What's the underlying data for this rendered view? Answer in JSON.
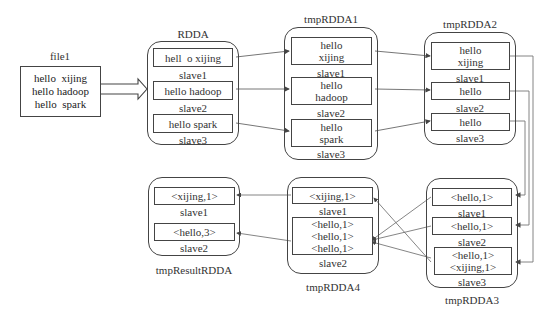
{
  "file1": {
    "title": "file1",
    "content": "hello  xijing\nhello hadoop\nhello  spark"
  },
  "rdda": {
    "title": "RDDA",
    "partitions": [
      {
        "text": "hell  o xijing",
        "node": "slave1"
      },
      {
        "text": "hello hadoop",
        "node": "slave2"
      },
      {
        "text": "hello spark",
        "node": "slave3"
      }
    ]
  },
  "tmpRDDA1": {
    "title": "tmpRDDA1",
    "partitions": [
      {
        "text": "hello\nxijing",
        "node": "slave1"
      },
      {
        "text": "hello\nhadoop",
        "node": "slave2"
      },
      {
        "text": "hello\nspark",
        "node": "slave3"
      }
    ]
  },
  "tmpRDDA2": {
    "title": "tmpRDDA2",
    "partitions": [
      {
        "text": "hello\nxijing",
        "node": "slave1"
      },
      {
        "text": "hello",
        "node": "slave2"
      },
      {
        "text": "hello",
        "node": "slave3"
      }
    ]
  },
  "tmpRDDA3": {
    "title": "tmpRDDA3",
    "partitions": [
      {
        "text": "<hello,1>",
        "node": "slave1"
      },
      {
        "text": "<hello,1>",
        "node": "slave2"
      },
      {
        "text": "<hello,1>\n<xijing,1>",
        "node": "slave3"
      }
    ]
  },
  "tmpRDDA4": {
    "title": "tmpRDDA4",
    "partitions": [
      {
        "text": "<xijing,1>",
        "node": "slave1"
      },
      {
        "text": "<hello,1>\n<hello,1>\n<hello,1>",
        "node": "slave2"
      }
    ]
  },
  "tmpResultRDDA": {
    "title": "tmpResultRDDA",
    "partitions": [
      {
        "text": "<xijing,1>",
        "node": "slave1"
      },
      {
        "text": "<hello,3>",
        "node": "slave2"
      }
    ]
  },
  "colors": {
    "line": "#555555",
    "border": "#444444",
    "text": "#333333"
  }
}
